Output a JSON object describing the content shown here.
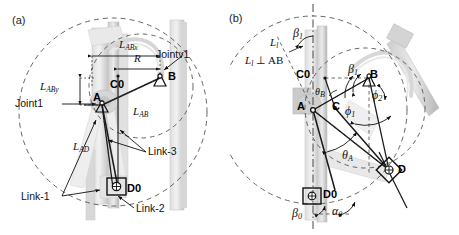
{
  "figure": {
    "panels": [
      {
        "id": "a",
        "tag": "(a)",
        "point_labels": [
          "A",
          "B",
          "C0",
          "D0"
        ],
        "measure_labels": [
          "L_ABx",
          "R",
          "L_ABy",
          "L_AB",
          "L_AD"
        ],
        "callouts": [
          "Joint1",
          "Jointv1",
          "Link-1",
          "Link-2",
          "Link-3"
        ],
        "labels": {
          "L_ABx": {
            "base": "L",
            "sub": "ABx"
          },
          "R": {
            "base": "R",
            "sub": ""
          },
          "L_ABy": {
            "base": "L",
            "sub": "ABy"
          },
          "L_AB": {
            "base": "L",
            "sub": "AB"
          },
          "L_AD": {
            "base": "L",
            "sub": "AD"
          },
          "A": "A",
          "B": "B",
          "C0": "C0",
          "D0": "D0",
          "joint1": "Joint1",
          "joint2": "Jointv1",
          "link1": "Link-1",
          "link2": "Link-2",
          "link3": "Link-3"
        }
      },
      {
        "id": "b",
        "tag": "(b)",
        "point_labels": [
          "A",
          "B",
          "C",
          "C0",
          "D",
          "D0"
        ],
        "angle_labels": [
          "beta_1_top",
          "beta_1_mid",
          "beta_0",
          "alpha_0",
          "phi_1",
          "phi_2",
          "theta_A",
          "theta_B"
        ],
        "labels": {
          "L_l": {
            "base": "L",
            "sub": "l"
          },
          "perp_note": {
            "base": "L",
            "sub": "l",
            "rest": " ⊥ AB"
          },
          "A": "A",
          "B": "B",
          "C": "C",
          "C0": "C0",
          "D": "D",
          "D0": "D0",
          "beta_top": {
            "base": "β",
            "sub": "1"
          },
          "beta_mid": {
            "base": "β",
            "sub": "1"
          },
          "beta_0": {
            "base": "β",
            "sub": "0"
          },
          "alpha_0": {
            "base": "α",
            "sub": "0"
          },
          "phi_1": {
            "base": "ϕ",
            "sub": "1"
          },
          "phi_2": {
            "base": "ϕ",
            "sub": "2"
          },
          "theta_A": {
            "base": "θ",
            "sub": "A"
          },
          "theta_B": {
            "base": "θ",
            "sub": "B"
          }
        }
      }
    ],
    "colors": {
      "ink": "#1a1a1a",
      "dashed_circle": "#4a4a4a",
      "photo_gray": "#c9c9c9",
      "photo_gray_light": "#e2e2e2",
      "photo_gray_dark": "#9a9a9a"
    }
  }
}
